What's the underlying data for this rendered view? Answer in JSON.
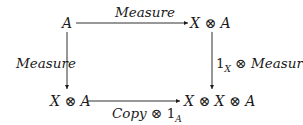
{
  "diagram": {
    "type": "commutative-square",
    "nodes": {
      "top_left": "A",
      "top_right": "X ⊗ A",
      "bottom_left": "X ⊗ A",
      "bottom_right": "X ⊗ X ⊗ A"
    },
    "arrows": {
      "top": {
        "from": "A",
        "to": "X ⊗ A",
        "label": "Measure"
      },
      "left": {
        "from": "A",
        "to": "X ⊗ A",
        "label": "Measure"
      },
      "right": {
        "from": "X ⊗ A",
        "to": "X ⊗ X ⊗ A",
        "label_prefix": "1",
        "label_sub": "X",
        "label_suffix": " ⊗ Measure"
      },
      "bottom": {
        "from": "X ⊗ A",
        "to": "X ⊗ X ⊗ A",
        "label_prefix": "Copy ⊗ ",
        "label_num": "1",
        "label_sub": "A"
      }
    },
    "colors": {
      "ink": "#1a1a1a",
      "background": "#ffffff"
    }
  }
}
